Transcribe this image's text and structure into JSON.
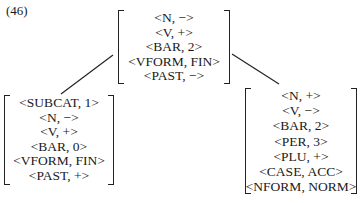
{
  "example_number": "(46)",
  "tree": {
    "root": {
      "features": [
        "<N, −>",
        "<V, +>",
        "<BAR, 2>",
        "<VFORM, FIN>",
        "<PAST, −>"
      ]
    },
    "left_child": {
      "features": [
        "<SUBCAT, 1>",
        "<N, −>",
        "<V, +>",
        "<BAR, 0>",
        "<VFORM, FIN>",
        "<PAST, +>"
      ]
    },
    "right_child": {
      "features": [
        "<N, +>",
        "<V, −>",
        "<BAR, 2>",
        "<PER, 3>",
        "<PLU, +>",
        "<CASE, ACC>",
        "<NFORM, NORM>"
      ]
    }
  }
}
